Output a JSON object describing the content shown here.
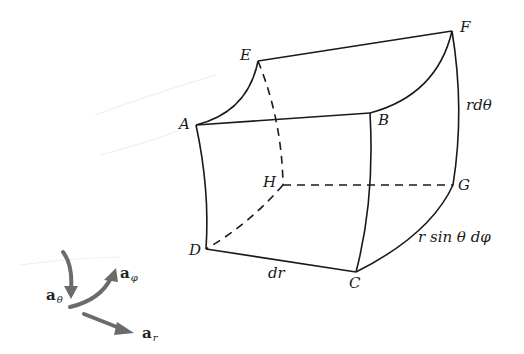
{
  "figure": {
    "vertices": {
      "A": "A",
      "B": "B",
      "C": "C",
      "D": "D",
      "E": "E",
      "F": "F",
      "G": "G",
      "H": "H"
    },
    "edge_labels": {
      "r_dtheta": "rdθ",
      "r_sin_theta_dphi": "r sin θ dφ",
      "dr": "dr"
    },
    "unit_vectors": {
      "a_theta": {
        "base": "a",
        "sub": "θ"
      },
      "a_phi": {
        "base": "a",
        "sub": "φ"
      },
      "a_r": {
        "base": "a",
        "sub": "r"
      }
    },
    "colors": {
      "line": "#1a1a1a",
      "arrow": "#6b6b6b",
      "background": "#ffffff"
    }
  }
}
